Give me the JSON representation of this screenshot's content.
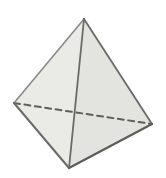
{
  "figure": {
    "kind": "tetrahedron-line-drawing",
    "background": "#ffffff",
    "canvas": {
      "width": 166,
      "height": 178
    },
    "vertices": {
      "apex": [
        84,
        19
      ],
      "left": [
        14,
        103
      ],
      "right": [
        152,
        124
      ],
      "bottom": [
        69,
        168
      ]
    },
    "faces": [
      {
        "name": "left-face",
        "points": [
          "apex",
          "left",
          "bottom"
        ],
        "fill": "#eaeae7"
      },
      {
        "name": "right-face",
        "points": [
          "apex",
          "bottom",
          "right"
        ],
        "fill": "#e3e3e0"
      }
    ],
    "edges": [
      {
        "name": "hidden-base-edge",
        "from": "left",
        "to": "right",
        "style": "dashed",
        "color": "#5f5e5a",
        "width": 2
      },
      {
        "name": "apex-left-edge",
        "from": "apex",
        "to": "left",
        "style": "solid",
        "color": "#8a8a86",
        "width": 1.6
      },
      {
        "name": "apex-right-edge",
        "from": "apex",
        "to": "right",
        "style": "solid",
        "color": "#6b6a66",
        "width": 1.8
      },
      {
        "name": "left-bottom-edge",
        "from": "left",
        "to": "bottom",
        "style": "solid",
        "color": "#6b6a66",
        "width": 2
      },
      {
        "name": "right-bottom-edge",
        "from": "right",
        "to": "bottom",
        "style": "solid",
        "color": "#5d5c58",
        "width": 2.2
      },
      {
        "name": "front-apex-bottom-edge",
        "from": "apex",
        "to": "bottom",
        "style": "solid",
        "color": "#6b6a66",
        "width": 1.8
      }
    ],
    "dash_pattern": "6 4.5"
  }
}
